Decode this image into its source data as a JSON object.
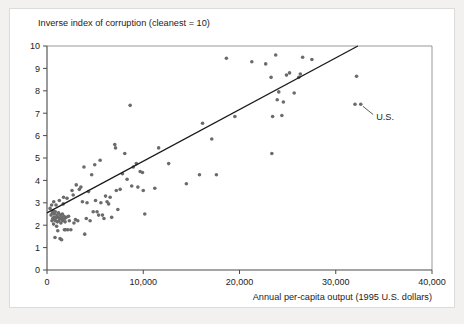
{
  "figure": {
    "background_color": "#f2f1ef",
    "card_color": "#ffffff",
    "frame_color": "#dcdbd8"
  },
  "chart_data": {
    "type": "scatter",
    "title": "",
    "ylabel": "Inverse index of corruption (cleanest = 10)",
    "xlabel": "Annual per-capita output (1995 U.S. dollars)",
    "xlim": [
      0,
      40000
    ],
    "ylim": [
      0,
      10
    ],
    "xticks": [
      0,
      10000,
      20000,
      30000,
      40000
    ],
    "xtick_labels": [
      "0",
      "10,000",
      "20,000",
      "30,000",
      "40,000"
    ],
    "yticks": [
      0,
      1,
      2,
      3,
      4,
      5,
      6,
      7,
      8,
      9,
      10
    ],
    "ytick_labels": [
      "0",
      "1",
      "2",
      "3",
      "4",
      "5",
      "6",
      "7",
      "8",
      "9",
      "10"
    ],
    "grid": false,
    "legend": null,
    "marker_color": "#6b6b6b",
    "marker_size": 3.6,
    "trendline": {
      "label": "",
      "color": "#1a1a1a",
      "x_start": 0,
      "y_start": 2.55,
      "x_end": 32300,
      "y_end": 10.0
    },
    "annotations": [
      {
        "text": "U.S.",
        "point_x": 32400,
        "point_y": 7.4,
        "label_x": 34200,
        "label_y": 6.85
      }
    ],
    "points": [
      [
        320,
        2.75
      ],
      [
        420,
        2.45
      ],
      [
        480,
        2.9
      ],
      [
        520,
        2.2
      ],
      [
        560,
        2.55
      ],
      [
        600,
        2.3
      ],
      [
        640,
        2.65
      ],
      [
        680,
        2.05
      ],
      [
        700,
        3.05
      ],
      [
        720,
        2.35
      ],
      [
        760,
        2.5
      ],
      [
        800,
        2.25
      ],
      [
        830,
        1.45
      ],
      [
        860,
        2.6
      ],
      [
        900,
        2.2
      ],
      [
        940,
        2.9
      ],
      [
        980,
        2.35
      ],
      [
        1000,
        1.95
      ],
      [
        1040,
        2.45
      ],
      [
        1080,
        2.15
      ],
      [
        1120,
        1.75
      ],
      [
        1160,
        2.35
      ],
      [
        1200,
        2.55
      ],
      [
        1240,
        2.2
      ],
      [
        1280,
        3.1
      ],
      [
        1320,
        2.3
      ],
      [
        1360,
        1.4
      ],
      [
        1400,
        2.45
      ],
      [
        1440,
        2.1
      ],
      [
        1480,
        2.35
      ],
      [
        1520,
        1.35
      ],
      [
        1560,
        2.25
      ],
      [
        1600,
        2.5
      ],
      [
        1640,
        2.2
      ],
      [
        1680,
        2.95
      ],
      [
        1720,
        3.25
      ],
      [
        1760,
        2.4
      ],
      [
        1800,
        1.8
      ],
      [
        1840,
        2.3
      ],
      [
        1880,
        2.15
      ],
      [
        1920,
        1.8
      ],
      [
        2000,
        2.35
      ],
      [
        2080,
        3.2
      ],
      [
        2160,
        1.8
      ],
      [
        2240,
        2.4
      ],
      [
        2320,
        2.2
      ],
      [
        2480,
        1.8
      ],
      [
        2600,
        3.55
      ],
      [
        2720,
        3.35
      ],
      [
        2800,
        2.1
      ],
      [
        2960,
        2.25
      ],
      [
        3040,
        3.8
      ],
      [
        3200,
        2.2
      ],
      [
        3360,
        3.6
      ],
      [
        3520,
        3.7
      ],
      [
        3680,
        3.05
      ],
      [
        3840,
        4.6
      ],
      [
        3920,
        1.6
      ],
      [
        4080,
        2.3
      ],
      [
        4160,
        3.0
      ],
      [
        4320,
        3.5
      ],
      [
        4480,
        2.2
      ],
      [
        4640,
        4.25
      ],
      [
        4800,
        2.6
      ],
      [
        4960,
        4.7
      ],
      [
        5040,
        3.1
      ],
      [
        5200,
        2.6
      ],
      [
        5360,
        2.45
      ],
      [
        5520,
        4.9
      ],
      [
        5600,
        3.0
      ],
      [
        5760,
        2.45
      ],
      [
        5920,
        2.3
      ],
      [
        6080,
        3.3
      ],
      [
        6240,
        3.05
      ],
      [
        6400,
        2.95
      ],
      [
        6560,
        3.25
      ],
      [
        6720,
        2.35
      ],
      [
        7040,
        5.6
      ],
      [
        7120,
        5.45
      ],
      [
        7200,
        3.55
      ],
      [
        7360,
        2.7
      ],
      [
        7600,
        3.6
      ],
      [
        7840,
        4.3
      ],
      [
        8080,
        5.2
      ],
      [
        8320,
        4.05
      ],
      [
        8640,
        7.35
      ],
      [
        8800,
        3.75
      ],
      [
        8960,
        4.6
      ],
      [
        9280,
        4.75
      ],
      [
        9440,
        3.7
      ],
      [
        9680,
        4.4
      ],
      [
        9920,
        4.35
      ],
      [
        10000,
        3.55
      ],
      [
        10160,
        2.5
      ],
      [
        11200,
        3.65
      ],
      [
        11600,
        5.45
      ],
      [
        12640,
        4.75
      ],
      [
        14480,
        3.85
      ],
      [
        15840,
        4.25
      ],
      [
        16160,
        6.55
      ],
      [
        17120,
        5.85
      ],
      [
        17600,
        4.25
      ],
      [
        18640,
        9.45
      ],
      [
        19520,
        6.85
      ],
      [
        21280,
        9.3
      ],
      [
        22720,
        9.2
      ],
      [
        23280,
        8.6
      ],
      [
        23360,
        5.2
      ],
      [
        23440,
        6.85
      ],
      [
        23760,
        9.6
      ],
      [
        23920,
        7.6
      ],
      [
        24080,
        7.95
      ],
      [
        24400,
        6.9
      ],
      [
        24560,
        7.5
      ],
      [
        24880,
        8.7
      ],
      [
        25200,
        8.8
      ],
      [
        25680,
        7.9
      ],
      [
        26160,
        8.6
      ],
      [
        26320,
        8.75
      ],
      [
        26560,
        9.5
      ],
      [
        27520,
        9.4
      ],
      [
        32000,
        7.4
      ],
      [
        32600,
        7.4
      ],
      [
        32160,
        8.65
      ]
    ]
  }
}
